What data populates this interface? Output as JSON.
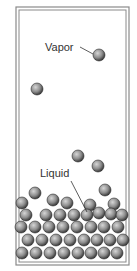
{
  "diagram": {
    "type": "phase-diagram-illustration",
    "container": {
      "outer": [
        16,
        7,
        113,
        258
      ],
      "inner": [
        19,
        10,
        107,
        252
      ]
    },
    "labels": {
      "vapor": {
        "text": "Vapor",
        "x": 45,
        "y": 51
      },
      "liquid": {
        "text": "Liquid",
        "x": 40,
        "y": 177
      }
    },
    "leaders": {
      "vapor": [
        80,
        47,
        93,
        54
      ],
      "liquid": [
        71,
        181,
        87,
        212
      ]
    },
    "ball_radius": 6,
    "colors": {
      "frame": "#8a8a8a",
      "ball_light": "#d6d6d6",
      "ball_mid": "#8c8c8c",
      "ball_dark": "#3a3a3a",
      "label": "#333333"
    },
    "vapor_balls": [
      [
        99,
        55
      ],
      [
        37,
        89
      ],
      [
        78,
        156
      ],
      [
        98,
        166
      ]
    ],
    "liquid_balls": [
      [
        35,
        193
      ],
      [
        105,
        190
      ],
      [
        53,
        200
      ],
      [
        67,
        203
      ],
      [
        22,
        203
      ],
      [
        90,
        205
      ],
      [
        114,
        204
      ],
      [
        26,
        215
      ],
      [
        46,
        215
      ],
      [
        60,
        215
      ],
      [
        74,
        215
      ],
      [
        87,
        215
      ],
      [
        99,
        213
      ],
      [
        111,
        214
      ],
      [
        122,
        215
      ],
      [
        21,
        227
      ],
      [
        35,
        227
      ],
      [
        49,
        227
      ],
      [
        63,
        227
      ],
      [
        77,
        227
      ],
      [
        91,
        227
      ],
      [
        104,
        227
      ],
      [
        118,
        227
      ],
      [
        28,
        240
      ],
      [
        42,
        240
      ],
      [
        56,
        240
      ],
      [
        70,
        240
      ],
      [
        84,
        240
      ],
      [
        97,
        240
      ],
      [
        110,
        240
      ],
      [
        123,
        240
      ],
      [
        22,
        253
      ],
      [
        36,
        253
      ],
      [
        50,
        253
      ],
      [
        64,
        253
      ],
      [
        78,
        253
      ],
      [
        91,
        253
      ],
      [
        104,
        253
      ],
      [
        117,
        253
      ]
    ]
  }
}
